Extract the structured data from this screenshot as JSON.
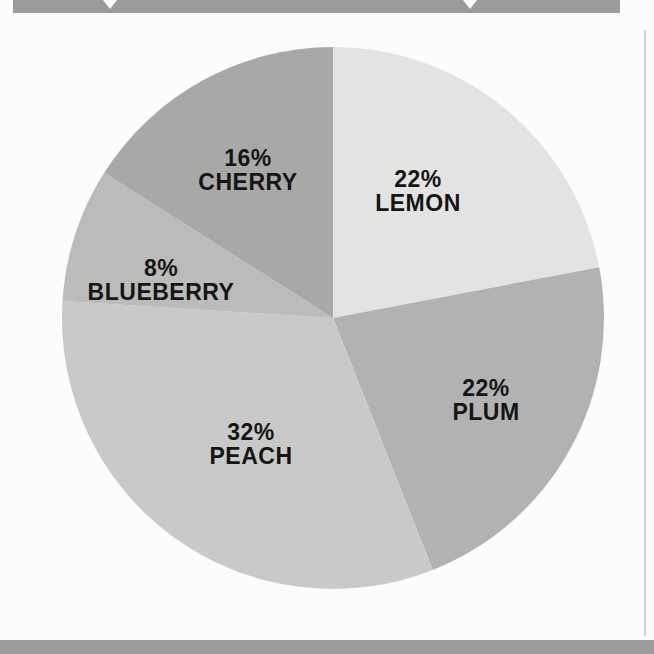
{
  "page": {
    "background": "#fcfcfb",
    "top_banner": {
      "color": "#9b9b9b",
      "icons": [
        {
          "name": "down-arrow-icon"
        },
        {
          "name": "down-arrow-icon"
        }
      ]
    },
    "bottom_banner": {
      "color": "#9b9b9b"
    },
    "page_edge_color": "#d2d2d0"
  },
  "chart_data": {
    "type": "pie",
    "title": "",
    "direction": "clockwise",
    "start_angle_deg": 0,
    "label_text_color": "#151515",
    "slices": [
      {
        "name": "LEMON",
        "value": 22,
        "label": "22%",
        "color": "#e3e3e1"
      },
      {
        "name": "PLUM",
        "value": 22,
        "label": "22%",
        "color": "#b2b2b2"
      },
      {
        "name": "PEACH",
        "value": 32,
        "label": "32%",
        "color": "#c9c9c8"
      },
      {
        "name": "BLUEBERRY",
        "value": 8,
        "label": "8%",
        "color": "#bbbbba"
      },
      {
        "name": "CHERRY",
        "value": 16,
        "label": "16%",
        "color": "#a8a8a7"
      }
    ]
  }
}
